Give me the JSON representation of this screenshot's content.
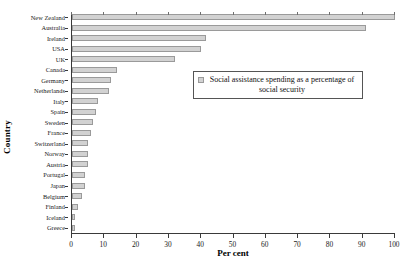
{
  "chart_data": {
    "type": "bar",
    "orientation": "horizontal",
    "title": "",
    "xlabel": "Per cent",
    "ylabel": "Country",
    "xlim": [
      0,
      100
    ],
    "xticks": [
      0,
      10,
      20,
      30,
      40,
      50,
      60,
      70,
      80,
      90,
      100
    ],
    "grid": false,
    "legend_position": "upper right inside plot",
    "series": [
      {
        "name": "Social assistance spending as a percentage of social security",
        "color": "#d2d2d2",
        "values": [
          100,
          91,
          41.5,
          40,
          32,
          14,
          12,
          11.5,
          8,
          7.5,
          6.5,
          6,
          5,
          5,
          5,
          4,
          4,
          3,
          2,
          1,
          0.8
        ]
      }
    ],
    "categories": [
      "New Zealand",
      "Australia",
      "Ireland",
      "USA",
      "UK",
      "Canada",
      "Germany",
      "Netherlands",
      "Italy",
      "Spain",
      "Sweden",
      "France",
      "Switzerland",
      "Norway",
      "Austria",
      "Portugal",
      "Japan",
      "Belgium",
      "Finland",
      "Iceland",
      "Greece"
    ],
    "data_points": [
      {
        "country": "New Zealand",
        "value": 100
      },
      {
        "country": "Australia",
        "value": 91
      },
      {
        "country": "Ireland",
        "value": 41.5
      },
      {
        "country": "USA",
        "value": 40
      },
      {
        "country": "UK",
        "value": 32
      },
      {
        "country": "Canada",
        "value": 14
      },
      {
        "country": "Germany",
        "value": 12
      },
      {
        "country": "Netherlands",
        "value": 11.5
      },
      {
        "country": "Italy",
        "value": 8
      },
      {
        "country": "Spain",
        "value": 7.5
      },
      {
        "country": "Sweden",
        "value": 6.5
      },
      {
        "country": "France",
        "value": 6
      },
      {
        "country": "Switzerland",
        "value": 5
      },
      {
        "country": "Norway",
        "value": 5
      },
      {
        "country": "Austria",
        "value": 5
      },
      {
        "country": "Portugal",
        "value": 4
      },
      {
        "country": "Japan",
        "value": 4
      },
      {
        "country": "Belgium",
        "value": 3
      },
      {
        "country": "Finland",
        "value": 2
      },
      {
        "country": "Iceland",
        "value": 1
      },
      {
        "country": "Greece",
        "value": 0.8
      }
    ]
  },
  "legend": {
    "label": "Social assistance spending as a percentage of social security"
  },
  "axes": {
    "x_title": "Per cent",
    "y_title": "Country"
  },
  "colors": {
    "bar_fill": "#d2d2d2",
    "bar_border": "#9a9a9a",
    "axis": "#3a3a3a",
    "text": "#111111",
    "background": "#ffffff"
  }
}
